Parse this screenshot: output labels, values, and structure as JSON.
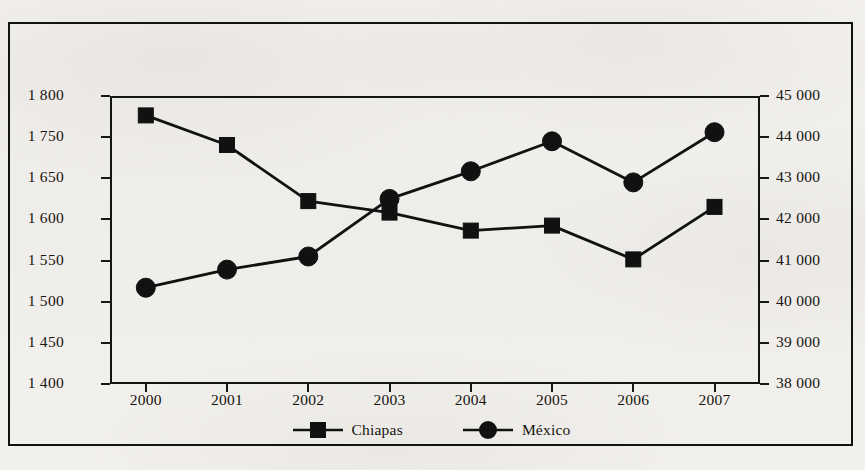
{
  "chart_data": {
    "type": "line",
    "title": "",
    "subtitle": "",
    "xlabel": "",
    "ylabel": "",
    "grid": false,
    "legend_position": "bottom",
    "categories": [
      "2000",
      "2001",
      "2002",
      "2003",
      "2004",
      "2005",
      "2006",
      "2007"
    ],
    "x_tick_labels": [
      "2000",
      "2001",
      "2002",
      "2003",
      "2004",
      "2005",
      "2006",
      "2007"
    ],
    "left_axis": {
      "label": "",
      "ylim": [
        1400,
        1800
      ],
      "tick_labels": [
        "1 800",
        "1 750",
        "1 650",
        "1 600",
        "1 550",
        "1 500",
        "1 450",
        "1 400"
      ],
      "tick_values": [
        1800,
        1750,
        1700,
        1650,
        1600,
        1550,
        1500,
        1450,
        1400
      ],
      "note_visible_labels_count": 8
    },
    "right_axis": {
      "label": "",
      "ylim": [
        38000,
        45000
      ],
      "tick_labels": [
        "45 000",
        "44 000",
        "43 000",
        "42 000",
        "41 000",
        "40 000",
        "39 000",
        "38 000"
      ],
      "tick_values": [
        45000,
        44000,
        43000,
        42000,
        41000,
        40000,
        39000,
        38000
      ]
    },
    "series": [
      {
        "name": "Chiapas",
        "axis": "left",
        "marker": "square",
        "color": "#111111",
        "values": [
          1773,
          1732,
          1654,
          1638,
          1613,
          1620,
          1573,
          1646
        ]
      },
      {
        "name": "México",
        "axis": "right",
        "marker": "circle",
        "color": "#111111",
        "values": [
          40340,
          40780,
          41100,
          42500,
          43170,
          43900,
          42900,
          44120
        ]
      }
    ]
  },
  "legend": {
    "items": [
      {
        "label": "Chiapas",
        "marker": "square"
      },
      {
        "label": "México",
        "marker": "circle"
      }
    ]
  },
  "colors": {
    "ink": "#111111",
    "paper": "#f2f0ec",
    "axis": "#141414"
  }
}
